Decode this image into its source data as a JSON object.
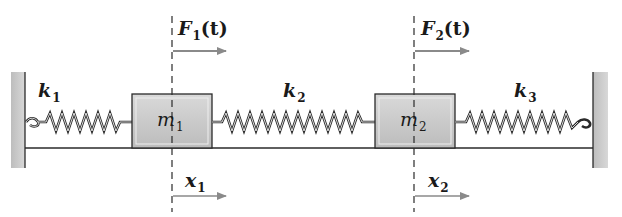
{
  "colors": {
    "wall": "#c9c9c9",
    "mass_fill": "#cfcfcf",
    "line": "#2a2a2a",
    "arrow": "#8a8a8a"
  },
  "walls": [
    {
      "id": "left-wall"
    },
    {
      "id": "right-wall"
    }
  ],
  "springs": [
    {
      "label": "k",
      "subscript": "1"
    },
    {
      "label": "k",
      "subscript": "2"
    },
    {
      "label": "k",
      "subscript": "3"
    }
  ],
  "masses": [
    {
      "label": "m",
      "subscript": "1"
    },
    {
      "label": "m",
      "subscript": "2"
    }
  ],
  "forces": [
    {
      "label": "F",
      "subscript": "1",
      "arg": "(t)"
    },
    {
      "label": "F",
      "subscript": "2",
      "arg": "(t)"
    }
  ],
  "displacements": [
    {
      "label": "x",
      "subscript": "1"
    },
    {
      "label": "x",
      "subscript": "2"
    }
  ]
}
